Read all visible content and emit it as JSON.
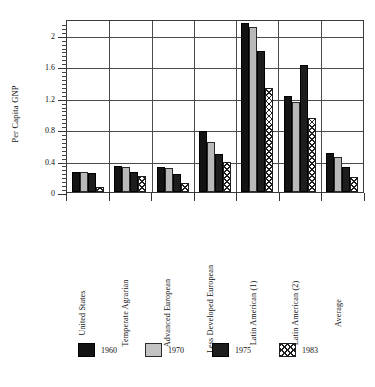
{
  "chart_data": {
    "type": "bar",
    "title": "",
    "xlabel": "",
    "ylabel": "Per Capita GNP",
    "ylim": [
      0,
      2.2
    ],
    "ytick_labels": [
      "0",
      "0.4",
      "0.8",
      "1.2",
      "1.6",
      "2"
    ],
    "ytick_values": [
      0,
      0.4,
      0.8,
      1.2,
      1.6,
      2
    ],
    "minor_tick_interval": 0.05,
    "grid": "horizontal-and-vertical",
    "legend_position": "bottom",
    "categories": [
      "United States",
      "Temperate Agrarian",
      "Advanced European",
      "Less Developed European",
      "Latin American (1)",
      "Latin American (2)",
      "Average"
    ],
    "series": [
      {
        "name": "1960",
        "color": "#131313",
        "pattern": "solid-black",
        "values": [
          0.25,
          0.33,
          0.32,
          0.78,
          2.15,
          1.22,
          0.5
        ]
      },
      {
        "name": "1970",
        "color": "#b9b9b9",
        "pattern": "solid-light-gray",
        "values": [
          0.25,
          0.32,
          0.3,
          0.63,
          2.1,
          1.15,
          0.45
        ]
      },
      {
        "name": "1975",
        "color": "#1d1d1d",
        "pattern": "solid-dark",
        "values": [
          0.24,
          0.26,
          0.23,
          0.48,
          1.79,
          1.62,
          0.32
        ]
      },
      {
        "name": "1983",
        "color": "#ffffff",
        "pattern": "cross-hatch",
        "values": [
          0.07,
          0.21,
          0.12,
          0.38,
          1.32,
          0.94,
          0.19
        ]
      }
    ]
  },
  "axis": {
    "y_title": "Per Capita GNP"
  },
  "legend": {
    "items": [
      {
        "label": "1960"
      },
      {
        "label": "1970"
      },
      {
        "label": "1975"
      },
      {
        "label": "1983"
      }
    ]
  }
}
